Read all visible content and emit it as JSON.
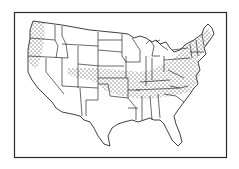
{
  "figure": {
    "type": "map",
    "style": "black-and-white line art with state borders",
    "frame": true,
    "colors": {
      "background": "#ffffff",
      "lines": "#2a2a2a",
      "stipple": "#1a1a1a"
    },
    "shaded_regions": [
      {
        "name": "Pacific Northwest coastal strip",
        "pattern": "stipple",
        "states": [
          "Washington (west)",
          "Oregon (west)",
          "California (far north coast)"
        ]
      },
      {
        "name": "Central and eastern band",
        "pattern": "stipple",
        "states": [
          "Colorado (north)",
          "Kansas",
          "Missouri",
          "Illinois",
          "Indiana",
          "Ohio",
          "Kentucky",
          "Tennessee",
          "Virginia",
          "West Virginia",
          "Pennsylvania",
          "Maryland",
          "Delaware",
          "New Jersey",
          "New York",
          "Connecticut",
          "Rhode Island",
          "Massachusetts",
          "Vermont",
          "New Hampshire",
          "Maine",
          "North Carolina (north)"
        ]
      }
    ]
  }
}
